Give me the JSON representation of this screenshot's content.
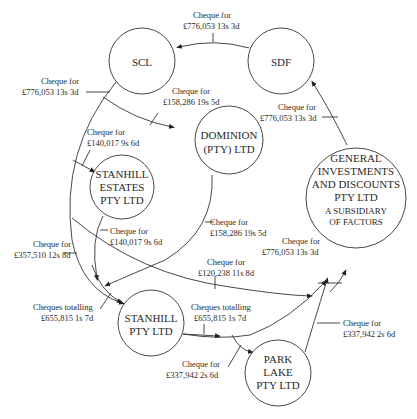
{
  "nodes": {
    "scl": {
      "label": "SCL"
    },
    "sdf": {
      "label": "SDF"
    },
    "dominion": {
      "line1": "DOMINION",
      "line2": "(PTY) LTD"
    },
    "stanhill_estates": {
      "line1": "STANHILL",
      "line2": "ESTATES",
      "line3": "PTY LTD"
    },
    "general": {
      "line1": "GENERAL",
      "line2": "INVESTMENTS",
      "line3": "AND DISCOUNTS",
      "line4": "PTY LTD",
      "sub1": "A SUBSIDIARY",
      "sub2": "OF FACTORS"
    },
    "stanhill": {
      "line1": "STANHILL",
      "line2": "PTY LTD"
    },
    "park_lake": {
      "line1": "PARK",
      "line2": "LAKE",
      "line3": "PTY LTD"
    }
  },
  "edges": {
    "sdf_to_scl": {
      "l1": "Cheque for",
      "l2": "£776,053 13s 3d"
    },
    "scl_down": {
      "l1": "Cheque for",
      "l2": "£776,053 13s 3d"
    },
    "scl_to_dominion": {
      "l1": "Cheque for",
      "l2": "£158,286 19s 5d"
    },
    "to_stanhill_estates": {
      "l1": "Cheque for",
      "l2": "£140,017 9s 6d"
    },
    "general_to_sdf": {
      "l1": "Cheque for",
      "l2": "£776,053 13s 3d"
    },
    "stanhill_estates_out": {
      "l1": "Cheque for",
      "l2": "£140,017 9s 6d"
    },
    "dominion_out": {
      "l1": "Cheque for",
      "l2": "£158,286 19s 5d"
    },
    "left_357": {
      "l1": "Cheque for",
      "l2": "£357,510 12s 8d"
    },
    "to_general_776": {
      "l1": "Cheque for",
      "l2": "£776,053 13s 3d"
    },
    "to_general_120": {
      "l1": "Cheque for",
      "l2": "£120,238 11s 8d"
    },
    "into_stanhill": {
      "l1": "Cheques totalling",
      "l2": "£655,815 1s 7d"
    },
    "stanhill_to_general": {
      "l1": "Cheques totalling",
      "l2": "£655,815 1s 7d"
    },
    "to_park_lake": {
      "l1": "Cheque for",
      "l2": "£337,942 2s 6d"
    },
    "park_lake_to_general": {
      "l1": "Cheque for",
      "l2": "£337,942 2s 6d"
    }
  }
}
